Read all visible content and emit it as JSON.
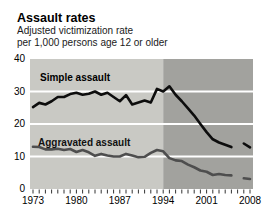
{
  "header": {
    "title": "Assault rates",
    "subtitle_line1": "Adjusted victimization rate",
    "subtitle_line2": "per 1,000 persons age 12 or older"
  },
  "chart_data": {
    "type": "line",
    "title": "Assault rates",
    "subtitle": "Adjusted victimization rate per 1,000 persons age 12 or older",
    "xlabel": "",
    "ylabel": "",
    "ylim": [
      0,
      40
    ],
    "xlim": [
      1973,
      2008
    ],
    "y_ticks": [
      40,
      30,
      20,
      10,
      0
    ],
    "x_ticks": [
      1973,
      1980,
      1987,
      1994,
      2001,
      2008
    ],
    "gridline_values": [
      30,
      20,
      10
    ],
    "grid": "white horizontal lines on gray panel",
    "legend_position": "labels inside plot",
    "background_split_year": 1994,
    "colors": {
      "panel_before_1994": "#c9c9c4",
      "panel_after_1994": "#a2a29e",
      "gridline": "#ffffff",
      "simple_line": "#0d0d0d",
      "aggravated_line": "#4e4e4e",
      "tick": "#333333"
    },
    "data_break_between": [
      2005,
      2007
    ],
    "series": [
      {
        "label": "Simple assault",
        "color": "#0d0d0d",
        "years": [
          1973,
          1974,
          1975,
          1976,
          1977,
          1978,
          1979,
          1980,
          1981,
          1982,
          1983,
          1984,
          1985,
          1986,
          1987,
          1988,
          1989,
          1990,
          1991,
          1992,
          1993,
          1994,
          1995,
          1996,
          1997,
          1998,
          1999,
          2000,
          2001,
          2002,
          2003,
          2004,
          2005
        ],
        "values": [
          25.2,
          26.5,
          26.0,
          27.0,
          28.3,
          28.3,
          29.2,
          29.6,
          29.0,
          29.3,
          30.0,
          29.0,
          29.6,
          28.3,
          27.0,
          28.9,
          26.0,
          26.6,
          27.2,
          26.6,
          30.8,
          30.0,
          31.6,
          29.0,
          27.0,
          24.8,
          22.6,
          20.0,
          17.5,
          15.3,
          14.3,
          13.6,
          12.9
        ],
        "post_break_years": [
          2007,
          2008
        ],
        "post_break_values": [
          14.0,
          12.8
        ]
      },
      {
        "label": "Aggravated assault",
        "color": "#4e4e4e",
        "years": [
          1973,
          1974,
          1975,
          1976,
          1977,
          1978,
          1979,
          1980,
          1981,
          1982,
          1983,
          1984,
          1985,
          1986,
          1987,
          1988,
          1989,
          1990,
          1991,
          1992,
          1993,
          1994,
          1995,
          1996,
          1997,
          1998,
          1999,
          2000,
          2001,
          2002,
          2003,
          2004,
          2005
        ],
        "values": [
          13.0,
          12.9,
          12.2,
          12.2,
          12.4,
          12.0,
          12.3,
          11.4,
          12.0,
          11.3,
          10.2,
          10.8,
          10.3,
          10.0,
          10.0,
          10.8,
          10.3,
          9.8,
          9.9,
          11.1,
          12.0,
          11.6,
          9.5,
          8.8,
          8.6,
          7.5,
          6.7,
          5.7,
          5.3,
          4.3,
          4.6,
          4.3,
          4.2
        ],
        "post_break_years": [
          2007,
          2008
        ],
        "post_break_values": [
          3.3,
          3.1
        ]
      }
    ]
  }
}
